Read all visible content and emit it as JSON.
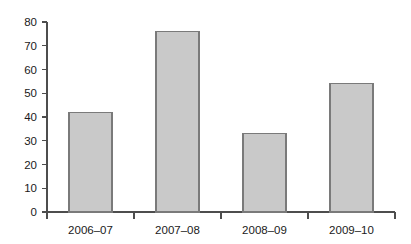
{
  "chart_data": {
    "type": "bar",
    "title": "",
    "subtitle": "",
    "xlabel": "",
    "ylabel": "",
    "categories": [
      "2006–07",
      "2007–08",
      "2008–09",
      "2009–10"
    ],
    "values": [
      42,
      76,
      33,
      54
    ],
    "series": [
      {
        "name": "",
        "values": [
          42,
          76,
          33,
          54
        ]
      }
    ],
    "ylim": [
      0,
      80
    ],
    "y_ticks": [
      0,
      10,
      20,
      30,
      40,
      50,
      60,
      70,
      80
    ],
    "y_tick_labels": [
      "0",
      "10",
      "20",
      "30",
      "40",
      "50",
      "60",
      "70",
      "80"
    ],
    "grid": false,
    "legend": false,
    "legend_position": "none",
    "annotations": [],
    "colors": {
      "bar_fill": "#c9c9c9",
      "bar_border": "#7a7a7a",
      "axis": "#4d4d4d",
      "text": "#1a1a1a",
      "background": "#ffffff"
    }
  },
  "axes": {
    "y_axis_name": "value-axis",
    "x_axis_name": "category-axis"
  }
}
